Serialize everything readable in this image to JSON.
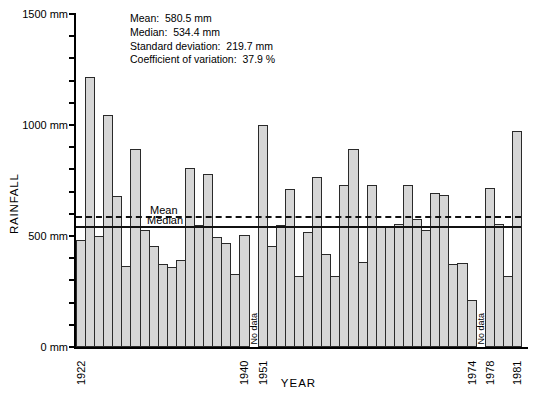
{
  "stats_box": {
    "lines": [
      "Mean:  580.5 mm",
      "Median:  534.4 mm",
      "Standard deviation:  219.7 mm",
      "Coefficient of variation:  37.9 %"
    ]
  },
  "colors": {
    "bar_fill": "#d6d6d6",
    "bar_border": "#2a2a2a",
    "axis": "#000000",
    "text": "#000000"
  },
  "chart_data": {
    "type": "bar",
    "title": "",
    "xlabel": "YEAR",
    "ylabel": "RAINFALL",
    "unit": "mm",
    "ylim": [
      0,
      1500
    ],
    "grid": false,
    "y_minor_step": 100,
    "y_ticks": [
      {
        "value": 1500,
        "label": "1500 mm"
      },
      {
        "value": 1000,
        "label": "1000 mm"
      },
      {
        "value": 500,
        "label": "500 mm"
      },
      {
        "value": 0,
        "label": "0 mm"
      }
    ],
    "labeled_years": [
      "1922",
      "1940",
      "1951",
      "1974",
      "1978",
      "1981"
    ],
    "no_data_label": "No data",
    "mean_line": {
      "label": "Mean",
      "value": 580.5,
      "style": "dashed"
    },
    "median_line": {
      "label": "Median",
      "value": 534.4,
      "style": "solid"
    },
    "bars": [
      {
        "year": "1922",
        "value": 480
      },
      {
        "year": "1923",
        "value": 1215
      },
      {
        "year": "1924",
        "value": 500
      },
      {
        "year": "1925",
        "value": 1045
      },
      {
        "year": "1926",
        "value": 680
      },
      {
        "year": "1927",
        "value": 365
      },
      {
        "year": "1928",
        "value": 890
      },
      {
        "year": "1929",
        "value": 525
      },
      {
        "year": "1930",
        "value": 455
      },
      {
        "year": "1931",
        "value": 375
      },
      {
        "year": "1932",
        "value": 360
      },
      {
        "year": "1933",
        "value": 390
      },
      {
        "year": "1934",
        "value": 805
      },
      {
        "year": "1935",
        "value": 550
      },
      {
        "year": "1936",
        "value": 780
      },
      {
        "year": "1937",
        "value": 495
      },
      {
        "year": "1938",
        "value": 470
      },
      {
        "year": "1939",
        "value": 330
      },
      {
        "year": "1940",
        "value": 505
      },
      {
        "no_data": true,
        "label": "No data"
      },
      {
        "year": "1951",
        "value": 1000
      },
      {
        "year": "1952",
        "value": 455
      },
      {
        "year": "1953",
        "value": 550
      },
      {
        "year": "1954",
        "value": 710
      },
      {
        "year": "1955",
        "value": 320
      },
      {
        "year": "1956",
        "value": 520
      },
      {
        "year": "1957",
        "value": 765
      },
      {
        "year": "1958",
        "value": 420
      },
      {
        "year": "1959",
        "value": 320
      },
      {
        "year": "1960",
        "value": 730
      },
      {
        "year": "1961",
        "value": 890
      },
      {
        "year": "1962",
        "value": 385
      },
      {
        "year": "1963",
        "value": 730
      },
      {
        "year": "1964",
        "value": 545
      },
      {
        "year": "1965",
        "value": 545
      },
      {
        "year": "1966",
        "value": 555
      },
      {
        "year": "1967",
        "value": 730
      },
      {
        "year": "1968",
        "value": 575
      },
      {
        "year": "1969",
        "value": 525
      },
      {
        "year": "1970",
        "value": 695
      },
      {
        "year": "1971",
        "value": 685
      },
      {
        "year": "1972",
        "value": 375
      },
      {
        "year": "1973",
        "value": 380
      },
      {
        "year": "1974",
        "value": 210
      },
      {
        "no_data": true,
        "label": "No data"
      },
      {
        "year": "1978",
        "value": 715
      },
      {
        "year": "1979",
        "value": 555
      },
      {
        "year": "1980",
        "value": 318
      },
      {
        "year": "1981",
        "value": 975
      }
    ]
  }
}
